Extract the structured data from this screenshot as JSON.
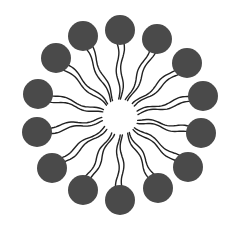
{
  "diagram": {
    "type": "micelle",
    "center": [
      120,
      117
    ],
    "core_radius": 16,
    "head_radius": 15,
    "head_color": "#4a4a4a",
    "tail_color": "#222222",
    "background": "#ffffff",
    "heads": [
      [
        120,
        30
      ],
      [
        157,
        39
      ],
      [
        187,
        63
      ],
      [
        203,
        96
      ],
      [
        201,
        133
      ],
      [
        188,
        167
      ],
      [
        158,
        188
      ],
      [
        120,
        200
      ],
      [
        83,
        190
      ],
      [
        52,
        168
      ],
      [
        37,
        132
      ],
      [
        38,
        94
      ],
      [
        56,
        58
      ],
      [
        83,
        36
      ]
    ]
  }
}
